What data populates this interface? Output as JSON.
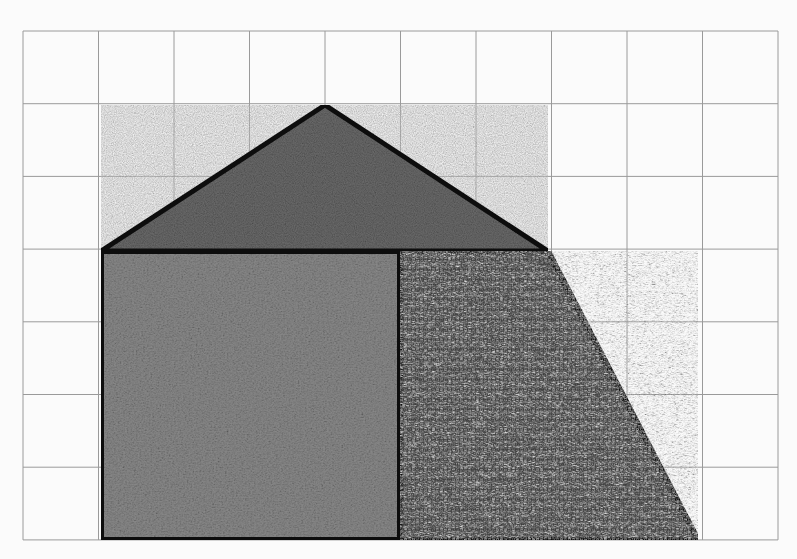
{
  "diagram": {
    "grid": {
      "columns": 10,
      "rows": 7,
      "origin_x": 23,
      "origin_y": 31,
      "cell_w": 75.5,
      "cell_h": 72.7,
      "line_color": "#9a9a9a",
      "background": "#fbfbfb"
    },
    "outline_color": "#111111",
    "shapes": [
      {
        "name": "triangle-roof",
        "kind": "triangle",
        "points_grid": [
          [
            1,
            3
          ],
          [
            4,
            1
          ],
          [
            7,
            3
          ]
        ],
        "points_px": [
          [
            101,
            251
          ],
          [
            325,
            105
          ],
          [
            548,
            251
          ]
        ],
        "fill": "#6e6e6e",
        "texture": "fine-speckle"
      },
      {
        "name": "square-left",
        "kind": "square",
        "points_grid": [
          [
            1,
            3
          ],
          [
            5,
            3
          ],
          [
            5,
            7
          ],
          [
            1,
            7
          ]
        ],
        "points_px": [
          [
            101,
            251
          ],
          [
            400,
            251
          ],
          [
            400,
            540
          ],
          [
            101,
            540
          ]
        ],
        "fill": "#808080",
        "texture": "grass"
      },
      {
        "name": "trapezoid-right",
        "kind": "right-trapezoid",
        "points_grid": [
          [
            5,
            3
          ],
          [
            7,
            3
          ],
          [
            9,
            7
          ],
          [
            5,
            7
          ]
        ],
        "points_px": [
          [
            400,
            251
          ],
          [
            548,
            251
          ],
          [
            698,
            540
          ],
          [
            400,
            540
          ]
        ],
        "fill": "#5a5a5a",
        "texture": "straw"
      }
    ]
  }
}
